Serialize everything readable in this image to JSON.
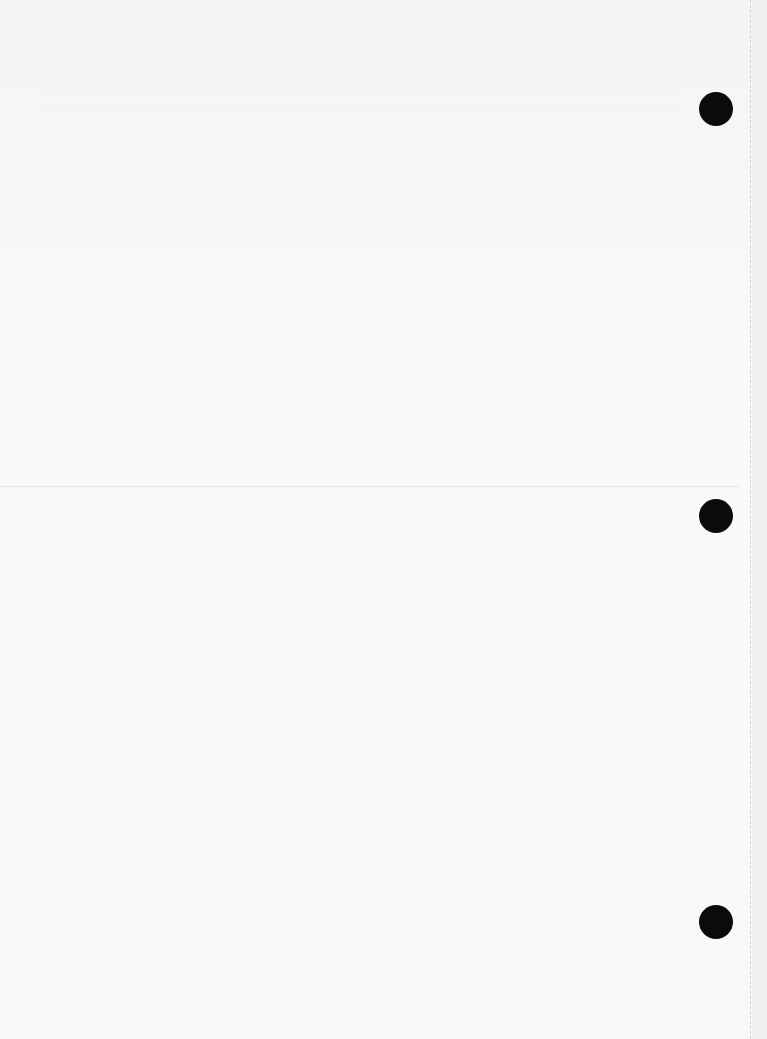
{
  "document": {
    "type": "scanned blank page",
    "text": "",
    "binder_holes": [
      {
        "cx": 716,
        "cy": 109
      },
      {
        "cx": 716,
        "cy": 516
      },
      {
        "cx": 716,
        "cy": 922
      }
    ],
    "colors": {
      "paper": "#f7f7f7",
      "hole": "#0b0b0b",
      "perforation": "#d2d2d2"
    }
  }
}
